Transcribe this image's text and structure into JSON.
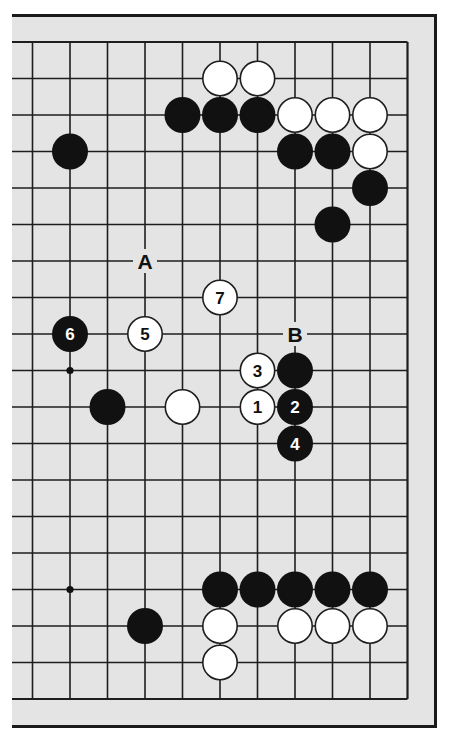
{
  "diagram": {
    "type": "go-board-partial",
    "colors": {
      "page_background": "#ffffff",
      "board_background": "#e4e4e4",
      "line": "#1e1e1e",
      "black_stone": "#111111",
      "white_stone": "#ffffff"
    },
    "visible_columns": 11,
    "visible_rows": 19,
    "edges": [
      "top",
      "right",
      "bottom"
    ],
    "star_points": [
      {
        "col": 1,
        "row": 9
      },
      {
        "col": 1,
        "row": 15
      }
    ],
    "stones": [
      {
        "color": "white",
        "col": 5,
        "row": 1,
        "label": ""
      },
      {
        "color": "white",
        "col": 6,
        "row": 1,
        "label": ""
      },
      {
        "color": "black",
        "col": 4,
        "row": 2,
        "label": ""
      },
      {
        "color": "black",
        "col": 5,
        "row": 2,
        "label": ""
      },
      {
        "color": "black",
        "col": 6,
        "row": 2,
        "label": ""
      },
      {
        "color": "white",
        "col": 7,
        "row": 2,
        "label": ""
      },
      {
        "color": "white",
        "col": 8,
        "row": 2,
        "label": ""
      },
      {
        "color": "white",
        "col": 9,
        "row": 2,
        "label": ""
      },
      {
        "color": "black",
        "col": 1,
        "row": 3,
        "label": ""
      },
      {
        "color": "black",
        "col": 7,
        "row": 3,
        "label": ""
      },
      {
        "color": "black",
        "col": 8,
        "row": 3,
        "label": ""
      },
      {
        "color": "white",
        "col": 9,
        "row": 3,
        "label": ""
      },
      {
        "color": "black",
        "col": 9,
        "row": 4,
        "label": ""
      },
      {
        "color": "black",
        "col": 8,
        "row": 5,
        "label": ""
      },
      {
        "color": "white",
        "col": 5,
        "row": 7,
        "label": "7"
      },
      {
        "color": "black",
        "col": 1,
        "row": 8,
        "label": "6"
      },
      {
        "color": "white",
        "col": 3,
        "row": 8,
        "label": "5"
      },
      {
        "color": "white",
        "col": 6,
        "row": 9,
        "label": "3"
      },
      {
        "color": "black",
        "col": 7,
        "row": 9,
        "label": ""
      },
      {
        "color": "black",
        "col": 2,
        "row": 10,
        "label": ""
      },
      {
        "color": "white",
        "col": 4,
        "row": 10,
        "label": ""
      },
      {
        "color": "white",
        "col": 6,
        "row": 10,
        "label": "1"
      },
      {
        "color": "black",
        "col": 7,
        "row": 10,
        "label": "2"
      },
      {
        "color": "black",
        "col": 7,
        "row": 11,
        "label": "4"
      },
      {
        "color": "black",
        "col": 5,
        "row": 15,
        "label": ""
      },
      {
        "color": "black",
        "col": 6,
        "row": 15,
        "label": ""
      },
      {
        "color": "black",
        "col": 7,
        "row": 15,
        "label": ""
      },
      {
        "color": "black",
        "col": 8,
        "row": 15,
        "label": ""
      },
      {
        "color": "black",
        "col": 9,
        "row": 15,
        "label": ""
      },
      {
        "color": "black",
        "col": 3,
        "row": 16,
        "label": ""
      },
      {
        "color": "white",
        "col": 5,
        "row": 16,
        "label": ""
      },
      {
        "color": "white",
        "col": 7,
        "row": 16,
        "label": ""
      },
      {
        "color": "white",
        "col": 8,
        "row": 16,
        "label": ""
      },
      {
        "color": "white",
        "col": 9,
        "row": 16,
        "label": ""
      },
      {
        "color": "white",
        "col": 5,
        "row": 17,
        "label": ""
      }
    ],
    "point_labels": [
      {
        "text": "A",
        "col": 3,
        "row": 6
      },
      {
        "text": "B",
        "col": 7,
        "row": 8
      }
    ],
    "move_sequence": [
      {
        "move": 1,
        "color": "white"
      },
      {
        "move": 2,
        "color": "black"
      },
      {
        "move": 3,
        "color": "white"
      },
      {
        "move": 4,
        "color": "black"
      },
      {
        "move": 5,
        "color": "white"
      },
      {
        "move": 6,
        "color": "black"
      },
      {
        "move": 7,
        "color": "white"
      }
    ]
  }
}
